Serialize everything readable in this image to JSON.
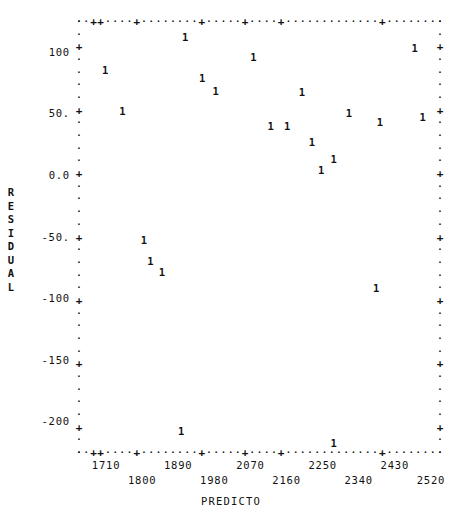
{
  "chart_data": {
    "type": "scatter",
    "title": "",
    "xlabel": "PREDICTO",
    "ylabel": "RESIDUAL",
    "marker": "1",
    "grid": false,
    "legend": null,
    "xlim": [
      1665,
      2565
    ],
    "ylim": [
      -225,
      125
    ],
    "xticks": [
      1710,
      1800,
      1890,
      1980,
      2070,
      2160,
      2250,
      2340,
      2430,
      2520
    ],
    "xtick_labels": [
      "1710",
      "1800",
      "1890",
      "1980",
      "2070",
      "2160",
      "2250",
      "2340",
      "2430",
      "2520"
    ],
    "yticks": [
      100,
      50,
      0,
      -50,
      -100,
      -150,
      -200
    ],
    "ytick_labels": [
      "100",
      "50.",
      "0.0",
      "-50.",
      "-100",
      "-150",
      "-200"
    ],
    "x": [
      1730,
      1773,
      1930,
      1972,
      2006,
      2100,
      2143,
      2184,
      2221,
      2246,
      2269,
      2300,
      2338,
      2415,
      2502,
      2522,
      1827,
      1843,
      1872,
      2406,
      1920,
      2300
    ],
    "y": [
      85,
      52,
      112,
      79,
      68,
      96,
      40,
      40,
      67,
      27,
      4,
      50,
      13,
      43,
      103,
      47,
      -53,
      -70,
      -79,
      -92,
      -208,
      -218
    ],
    "points": [
      {
        "x": 1730,
        "y": 85
      },
      {
        "x": 1773,
        "y": 52
      },
      {
        "x": 1827,
        "y": -53
      },
      {
        "x": 1843,
        "y": -70
      },
      {
        "x": 1872,
        "y": -79
      },
      {
        "x": 1920,
        "y": -208
      },
      {
        "x": 1930,
        "y": 112
      },
      {
        "x": 1972,
        "y": 79
      },
      {
        "x": 2006,
        "y": 68
      },
      {
        "x": 2100,
        "y": 96
      },
      {
        "x": 2143,
        "y": 40
      },
      {
        "x": 2184,
        "y": 40
      },
      {
        "x": 2221,
        "y": 67
      },
      {
        "x": 2246,
        "y": 27
      },
      {
        "x": 2269,
        "y": 4
      },
      {
        "x": 2300,
        "y": 13
      },
      {
        "x": 2300,
        "y": -218
      },
      {
        "x": 2338,
        "y": 50
      },
      {
        "x": 2406,
        "y": -92
      },
      {
        "x": 2415,
        "y": 43
      },
      {
        "x": 2502,
        "y": 103
      },
      {
        "x": 2522,
        "y": 47
      }
    ]
  },
  "axes": {
    "y_title_chars": [
      "R",
      "E",
      "S",
      "I",
      "D",
      "U",
      "A",
      "L"
    ],
    "x_title": "PREDICTO"
  }
}
